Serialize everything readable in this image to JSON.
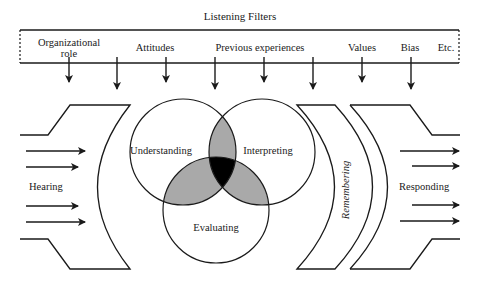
{
  "title": "Listening Filters",
  "filters": {
    "items": [
      {
        "label_line1": "Organizational",
        "label_line2": "role"
      },
      {
        "label": "Attitudes"
      },
      {
        "label": "Previous experiences"
      },
      {
        "label": "Values"
      },
      {
        "label": "Bias"
      },
      {
        "label": "Etc."
      }
    ]
  },
  "stages": {
    "hearing": "Hearing",
    "understanding": "Understanding",
    "interpreting": "Interpreting",
    "evaluating": "Evaluating",
    "remembering": "Remembering",
    "responding": "Responding"
  },
  "colors": {
    "stroke": "#1a1a1a",
    "overlap_two": "#a9a9a9",
    "overlap_three": "#000000",
    "background": "#ffffff"
  }
}
